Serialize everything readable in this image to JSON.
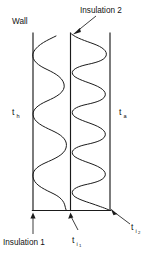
{
  "figure": {
    "background_color": "#ffffff",
    "line_color": "#1b1b1b",
    "width": 160,
    "height": 255
  },
  "labels": {
    "wall": "Wall",
    "insulation_2": "Insulation 2",
    "insulation_1": "Insulation 1",
    "t_hot_base": "t",
    "t_hot_sub": "h",
    "t_ambient_base": "t",
    "t_ambient_sub": "a",
    "t_i1_base": "t",
    "t_i1_sub": "i",
    "t_i1_subsub": "1",
    "t_i2_base": "t",
    "t_i2_sub": "i",
    "t_i2_subsub": "2"
  },
  "geometry": {
    "left_wall_x": 33,
    "middle_wall_x": 70.5,
    "right_wall_x": 110,
    "top_y": 33,
    "bottom_y": 210
  },
  "waves": {
    "left_chamber": {
      "name": "insulation-1-temperature-wave",
      "oscillations": 5,
      "amplitude_px": 18,
      "frequency": "low"
    },
    "right_chamber": {
      "name": "insulation-2-temperature-wave",
      "oscillations": 8,
      "amplitude_px": 19,
      "frequency": "high"
    }
  },
  "annotations": [
    {
      "id": "wall",
      "label": "Wall",
      "has_arrow": false
    },
    {
      "id": "insulation-2",
      "label": "Insulation 2",
      "has_arrow": true,
      "points_to": "middle-wall-top"
    },
    {
      "id": "insulation-1",
      "label": "Insulation 1",
      "has_arrow": true,
      "points_to": "left-wall-bottom"
    },
    {
      "id": "t-i1",
      "label": "t i 1",
      "has_arrow": true,
      "points_to": "middle-wall-bottom"
    },
    {
      "id": "t-i2",
      "label": "t i 2",
      "has_arrow": true,
      "points_to": "right-wall-bottom"
    },
    {
      "id": "t-h",
      "label": "t h",
      "has_arrow": false
    },
    {
      "id": "t-a",
      "label": "t a",
      "has_arrow": false
    }
  ]
}
